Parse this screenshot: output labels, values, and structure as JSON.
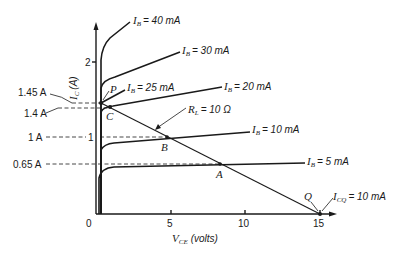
{
  "diagram": {
    "type": "transistor-output-characteristics",
    "y_axis": {
      "label_main": "I",
      "label_sub": "C",
      "label_unit": "(A)",
      "ticks": [
        {
          "value": "1",
          "y": 137
        },
        {
          "value": "2",
          "y": 62
        }
      ]
    },
    "x_axis": {
      "label_main": "V",
      "label_sub": "CE",
      "label_unit": "(volts)",
      "ticks": [
        {
          "value": "0",
          "x": 92
        },
        {
          "value": "5",
          "x": 171
        },
        {
          "value": "10",
          "x": 245
        },
        {
          "value": "15",
          "x": 320
        }
      ]
    },
    "curves": [
      {
        "ib_sub": "B",
        "label": "= 40 mA",
        "path": "M101 214 L101 60 Q102 46 110 38 L130 22",
        "lx": 133,
        "ly": 21
      },
      {
        "ib_sub": "B",
        "label": "= 30 mA",
        "path": "M101 214 L101 88 Q103 80 115 77 L180 52",
        "lx": 182,
        "ly": 51
      },
      {
        "ib_sub": "B",
        "label": "= 25 mA",
        "path": "M101 214 L101 102 Q103 97 110 96 L125 89",
        "lx": 128,
        "ly": 89
      },
      {
        "ib_sub": "B",
        "label": "= 20 mA",
        "path": "M101 214 L101 110 Q103 106 115 105 L222 86",
        "lx": 224,
        "ly": 89
      },
      {
        "ib_sub": "B",
        "label": "= 10 mA",
        "path": "M101 214 L101 148 Q104 143 112 143 L250 132",
        "lx": 252,
        "ly": 131
      },
      {
        "ib_sub": "B",
        "label": "= 5 mA",
        "path": "M101 214 L98 175 Q101 167 112 166 L305 163",
        "lx": 307,
        "ly": 164
      }
    ],
    "load_line": {
      "label_main": "R",
      "label_sub": "L",
      "label_value": "= 10 Ω",
      "x1": 101,
      "y1": 103,
      "x2": 320,
      "y2": 214
    },
    "points": [
      {
        "name": "P",
        "x": 101,
        "y": 103
      },
      {
        "name": "C",
        "x": 110,
        "y": 107
      },
      {
        "name": "B",
        "x": 167,
        "y": 137
      },
      {
        "name": "A",
        "x": 220,
        "y": 164
      },
      {
        "name": "Q",
        "x": 320,
        "y": 214
      }
    ],
    "current_markers": [
      {
        "label": "1.45 A",
        "y": 103
      },
      {
        "label": "1.4 A",
        "y": 108
      },
      {
        "label": "1 A",
        "y": 137
      },
      {
        "label": "0.65 A",
        "y": 164
      }
    ],
    "quiescent_label": {
      "main": "I",
      "sub": "CQ",
      "value": "= 10 mA"
    }
  }
}
